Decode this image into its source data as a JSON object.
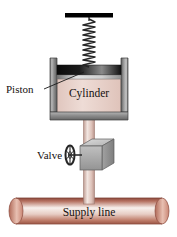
{
  "figure": {
    "background_color": "#ffffff",
    "width": 177,
    "height": 237
  },
  "labels": {
    "piston": "Piston",
    "cylinder": "Cylinder",
    "valve": "Valve",
    "supply_line": "Supply line"
  },
  "components": {
    "support_bar": {
      "name": "ceiling-support-bar",
      "color": "#000000"
    },
    "spring": {
      "name": "coil-spring",
      "coils": 22,
      "color": "#2b2b2b"
    },
    "cylinder_wall": {
      "name": "cylinder-wall",
      "color": "#8d8d8d",
      "highlight_color": "#d5d5d5",
      "outline_color": "#3a3a3a"
    },
    "piston": {
      "name": "piston-plate",
      "color_dark": "#111111",
      "color_light": "#d9d9d9"
    },
    "gas_region": {
      "name": "cylinder-gas-region",
      "color": "#e8d2cb"
    },
    "stem_pipe": {
      "name": "vertical-stem-pipe",
      "color": "#e2c9c2",
      "shade_color": "#c8a79e"
    },
    "valve_body": {
      "name": "valve-body-cube",
      "top_face_color": "#cfcfcf",
      "front_face_color": "#a9a9a9",
      "side_face_color": "#919191"
    },
    "handwheel": {
      "name": "valve-handwheel",
      "color": "#2f2f2f",
      "spokes": 4
    },
    "supply_line": {
      "name": "supply-line-pipe",
      "color_top": "#9c5246",
      "color_mid": "#f6eeea",
      "color_bottom": "#b06a58",
      "cap_color": "#d8a091"
    }
  },
  "leader_lines": {
    "piston_leader": {
      "name": "piston-leader-line",
      "color": "#1a1a1a"
    }
  }
}
